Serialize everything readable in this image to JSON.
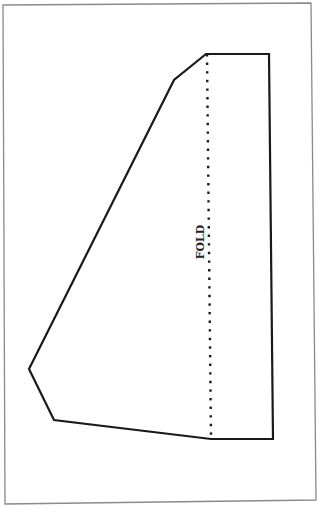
{
  "diagram": {
    "type": "sewing-pattern-piece",
    "fold_label": "FOLD",
    "colors": {
      "background": "#ffffff",
      "frame": "#8a8a8a",
      "outline": "#1a1a1a",
      "fold_line": "#1a1a1a"
    },
    "frame": {
      "points": [
        [
          3,
          5
        ],
        [
          311,
          3
        ],
        [
          316,
          500
        ],
        [
          5,
          504
        ]
      ]
    },
    "outline": {
      "points": [
        [
          206,
          54
        ],
        [
          269,
          54
        ],
        [
          273,
          439
        ],
        [
          211,
          439
        ],
        [
          54,
          420
        ],
        [
          29,
          369
        ],
        [
          174,
          80
        ]
      ]
    },
    "fold_line": {
      "from": [
        207,
        54
      ],
      "to": [
        211,
        439
      ]
    }
  }
}
